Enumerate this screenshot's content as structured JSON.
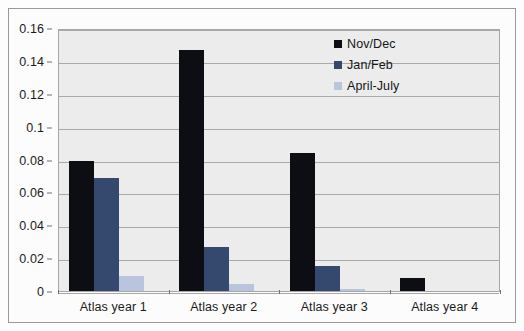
{
  "chart_data": {
    "type": "bar",
    "title": "",
    "subtitle": "",
    "xlabel": "",
    "ylabel": "",
    "categories": [
      "Atlas year 1",
      "Atlas year 2",
      "Atlas year 3",
      "Atlas year 4"
    ],
    "series": [
      {
        "name": "Nov/Dec",
        "color": "#0d0d14",
        "values": [
          0.079,
          0.1465,
          0.084,
          0.008
        ]
      },
      {
        "name": "Jan/Feb",
        "color": "#35496e",
        "values": [
          0.069,
          0.027,
          0.0155,
          0.0
        ]
      },
      {
        "name": "April-July",
        "color": "#b9c4dd",
        "values": [
          0.009,
          0.004,
          0.001,
          0.0
        ]
      }
    ],
    "ylim": [
      0,
      0.16
    ],
    "y_tick_labels": [
      "0",
      "0.02",
      "0.04",
      "0.06",
      "0.08",
      "0.1",
      "0.12",
      "0.14",
      "0.16"
    ],
    "y_tick_values": [
      0,
      0.02,
      0.04,
      0.06,
      0.08,
      0.1,
      0.12,
      0.14,
      0.16
    ],
    "grid": true,
    "grid_axis": "y",
    "legend_position": "top-right",
    "plot_background": "#ececed",
    "figure_background": "#fdfdfd",
    "gridline_color": "#a9a9aa",
    "axis_color": "#6f6f70"
  }
}
